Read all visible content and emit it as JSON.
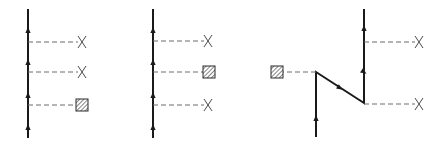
{
  "figure": {
    "width": 444,
    "height": 146,
    "colors": {
      "line": "#1a1a1a",
      "dash": "#6a6a6a",
      "cross": "#4a4a4a",
      "background": "#ffffff"
    }
  },
  "diagrams": [
    {
      "name": "diagram-a",
      "path": [
        [
          28,
          137
        ],
        [
          28,
          10
        ]
      ],
      "arrows": [
        [
          28,
          127
        ],
        [
          28,
          95
        ],
        [
          28,
          62
        ],
        [
          28,
          30
        ]
      ],
      "markers": [
        {
          "type": "cross",
          "line_y": 42,
          "x": 82
        },
        {
          "type": "cross",
          "line_y": 72,
          "x": 82
        },
        {
          "type": "hatched-square",
          "line_y": 105,
          "x": 82
        }
      ],
      "dash_from_x": 28,
      "dash_to_x": 78
    },
    {
      "name": "diagram-b",
      "path": [
        [
          153,
          137
        ],
        [
          153,
          10
        ]
      ],
      "arrows": [
        [
          153,
          127
        ],
        [
          153,
          95
        ],
        [
          153,
          62
        ],
        [
          153,
          30
        ]
      ],
      "markers": [
        {
          "type": "cross",
          "line_y": 41,
          "x": 208
        },
        {
          "type": "hatched-square",
          "line_y": 72,
          "x": 209
        },
        {
          "type": "cross",
          "line_y": 105,
          "x": 208
        }
      ],
      "dash_from_x": 153,
      "dash_to_x": 204
    },
    {
      "name": "diagram-c",
      "path": [
        [
          316,
          136
        ],
        [
          316,
          72
        ],
        [
          364,
          103
        ],
        [
          364,
          10
        ]
      ],
      "arrows": [
        [
          316,
          118
        ],
        [
          340,
          88
        ],
        [
          364,
          72
        ],
        [
          364,
          28
        ]
      ],
      "markers": [
        {
          "type": "hatched-square",
          "line_y": 72,
          "x": 277,
          "from_x": 316,
          "side": "left"
        },
        {
          "type": "cross",
          "line_y": 42,
          "x": 419,
          "from_x": 364,
          "side": "right"
        },
        {
          "type": "cross",
          "line_y": 104,
          "x": 419,
          "from_x": 364,
          "side": "right"
        }
      ]
    }
  ]
}
